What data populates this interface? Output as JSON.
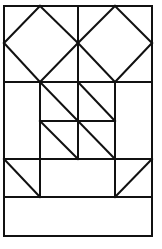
{
  "diagram": {
    "type": "quilt-block-pattern",
    "stroke_color": "#111111",
    "background": "#ffffff",
    "frame": {
      "x1": 4,
      "y1": 6,
      "x2": 152,
      "y2": 236
    },
    "segments": [
      {
        "id": "top-diamond-left-1",
        "x1": 4,
        "y1": 43,
        "x2": 40,
        "y2": 6
      },
      {
        "id": "top-diamond-left-2",
        "x1": 40,
        "y1": 6,
        "x2": 78,
        "y2": 43
      },
      {
        "id": "top-diamond-left-3",
        "x1": 78,
        "y1": 43,
        "x2": 40,
        "y2": 82
      },
      {
        "id": "top-diamond-left-4",
        "x1": 40,
        "y1": 82,
        "x2": 4,
        "y2": 43
      },
      {
        "id": "top-diamond-right-1",
        "x1": 78,
        "y1": 43,
        "x2": 115,
        "y2": 6
      },
      {
        "id": "top-diamond-right-2",
        "x1": 115,
        "y1": 6,
        "x2": 152,
        "y2": 43
      },
      {
        "id": "top-diamond-right-3",
        "x1": 152,
        "y1": 43,
        "x2": 115,
        "y2": 82
      },
      {
        "id": "top-diamond-right-4",
        "x1": 115,
        "y1": 82,
        "x2": 78,
        "y2": 43
      },
      {
        "id": "center-vertical-top",
        "x1": 78,
        "y1": 6,
        "x2": 78,
        "y2": 159
      },
      {
        "id": "horizontal-row-1",
        "x1": 4,
        "y1": 82,
        "x2": 152,
        "y2": 82
      },
      {
        "id": "inner-left-vertical",
        "x1": 40,
        "y1": 82,
        "x2": 40,
        "y2": 197
      },
      {
        "id": "inner-right-vertical",
        "x1": 115,
        "y1": 82,
        "x2": 115,
        "y2": 197
      },
      {
        "id": "horizontal-mid",
        "x1": 40,
        "y1": 121,
        "x2": 115,
        "y2": 121
      },
      {
        "id": "diag-upper-left",
        "x1": 40,
        "y1": 82,
        "x2": 78,
        "y2": 121
      },
      {
        "id": "diag-upper-right",
        "x1": 78,
        "y1": 82,
        "x2": 115,
        "y2": 121
      },
      {
        "id": "diag-lower-left",
        "x1": 40,
        "y1": 121,
        "x2": 78,
        "y2": 159
      },
      {
        "id": "diag-lower-right",
        "x1": 78,
        "y1": 121,
        "x2": 115,
        "y2": 159
      },
      {
        "id": "horizontal-row-2",
        "x1": 4,
        "y1": 159,
        "x2": 152,
        "y2": 159
      },
      {
        "id": "corner-diag-left",
        "x1": 4,
        "y1": 159,
        "x2": 40,
        "y2": 197
      },
      {
        "id": "corner-diag-right",
        "x1": 152,
        "y1": 159,
        "x2": 115,
        "y2": 197
      },
      {
        "id": "horizontal-row-3",
        "x1": 4,
        "y1": 197,
        "x2": 152,
        "y2": 197
      }
    ]
  }
}
